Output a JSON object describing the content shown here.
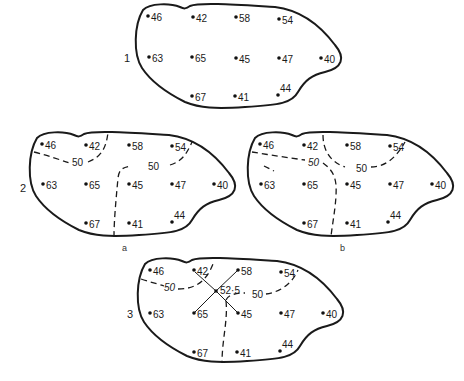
{
  "figure": {
    "panels": [
      {
        "id": "1",
        "label": "1",
        "sublabel": "",
        "stations": [
          {
            "value": "46",
            "x": 148,
            "y": 16
          },
          {
            "value": "42",
            "x": 193,
            "y": 17
          },
          {
            "value": "58",
            "x": 236,
            "y": 17
          },
          {
            "value": "54",
            "x": 279,
            "y": 19
          },
          {
            "value": "63",
            "x": 149,
            "y": 57
          },
          {
            "value": "65",
            "x": 192,
            "y": 57
          },
          {
            "value": "45",
            "x": 236,
            "y": 58
          },
          {
            "value": "47",
            "x": 279,
            "y": 58
          },
          {
            "value": "40",
            "x": 321,
            "y": 58
          },
          {
            "value": "67",
            "x": 192,
            "y": 96
          },
          {
            "value": "41",
            "x": 235,
            "y": 96
          },
          {
            "value": "44",
            "x": 278,
            "y": 95
          }
        ]
      },
      {
        "id": "2a",
        "label": "2",
        "sublabel": "a",
        "contour_labels": [
          "50",
          "50"
        ],
        "stations": [
          {
            "value": "46",
            "x": 42,
            "y": 144
          },
          {
            "value": "42",
            "x": 86,
            "y": 145
          },
          {
            "value": "58",
            "x": 129,
            "y": 145
          },
          {
            "value": "54",
            "x": 172,
            "y": 146
          },
          {
            "value": "63",
            "x": 43,
            "y": 184
          },
          {
            "value": "65",
            "x": 86,
            "y": 184
          },
          {
            "value": "45",
            "x": 129,
            "y": 184
          },
          {
            "value": "47",
            "x": 172,
            "y": 184
          },
          {
            "value": "40",
            "x": 214,
            "y": 184
          },
          {
            "value": "67",
            "x": 86,
            "y": 223
          },
          {
            "value": "41",
            "x": 129,
            "y": 223
          },
          {
            "value": "44",
            "x": 172,
            "y": 222
          }
        ]
      },
      {
        "id": "2b",
        "label": "",
        "sublabel": "b",
        "contour_labels": [
          "50",
          "50"
        ],
        "stations": [
          {
            "value": "46",
            "x": 260,
            "y": 144
          },
          {
            "value": "42",
            "x": 304,
            "y": 145
          },
          {
            "value": "58",
            "x": 347,
            "y": 145
          },
          {
            "value": "54",
            "x": 390,
            "y": 146
          },
          {
            "value": "63",
            "x": 261,
            "y": 184
          },
          {
            "value": "65",
            "x": 304,
            "y": 184
          },
          {
            "value": "45",
            "x": 347,
            "y": 184
          },
          {
            "value": "47",
            "x": 390,
            "y": 184
          },
          {
            "value": "40",
            "x": 432,
            "y": 184
          },
          {
            "value": "67",
            "x": 304,
            "y": 223
          },
          {
            "value": "41",
            "x": 347,
            "y": 223
          },
          {
            "value": "44",
            "x": 388,
            "y": 222
          }
        ]
      },
      {
        "id": "3",
        "label": "3",
        "sublabel": "",
        "contour_labels": [
          "50",
          "50"
        ],
        "interpolated_point": {
          "value": "52·5",
          "x": 216,
          "y": 291
        },
        "stations": [
          {
            "value": "46",
            "x": 150,
            "y": 270
          },
          {
            "value": "42",
            "x": 194,
            "y": 270
          },
          {
            "value": "58",
            "x": 238,
            "y": 270
          },
          {
            "value": "54",
            "x": 281,
            "y": 272
          },
          {
            "value": "63",
            "x": 150,
            "y": 313
          },
          {
            "value": "65",
            "x": 194,
            "y": 313
          },
          {
            "value": "45",
            "x": 238,
            "y": 313
          },
          {
            "value": "47",
            "x": 281,
            "y": 313
          },
          {
            "value": "40",
            "x": 323,
            "y": 313
          },
          {
            "value": "67",
            "x": 194,
            "y": 352
          },
          {
            "value": "41",
            "x": 237,
            "y": 352
          },
          {
            "value": "44",
            "x": 280,
            "y": 351
          }
        ]
      }
    ]
  }
}
